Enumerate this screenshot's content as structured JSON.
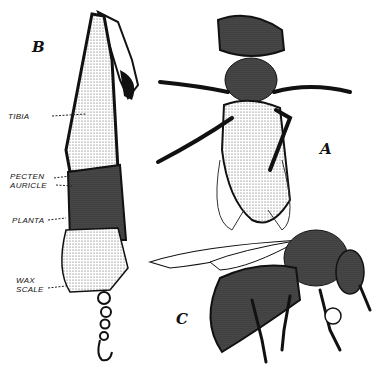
{
  "figures": {
    "a": {
      "letter": "A",
      "subject": "bee-ventral-view"
    },
    "b": {
      "letter": "B",
      "subject": "hind-leg-detail"
    },
    "c": {
      "letter": "C",
      "subject": "bee-side-view"
    }
  },
  "leg_labels": {
    "tibia": "TIBIA",
    "pecten": "PECTEN",
    "auricle": "AURICLE",
    "planta": "PLANTA",
    "wax_line1": "WAX",
    "wax_line2": "SCALE"
  },
  "colors": {
    "ink": "#111111",
    "paper": "#ffffff",
    "stipple": "#d8d8d8"
  }
}
